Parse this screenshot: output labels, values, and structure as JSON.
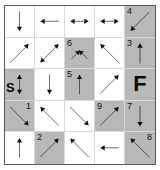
{
  "puzzle": {
    "title": "Arrow Maze Grid",
    "rows": 5,
    "columns": 5,
    "colors": {
      "shaded_cell": "#b8b8b8",
      "plain_cell": "#ffffff",
      "grid_line": "#d8d8d8",
      "frame_border": "#5a5a5a",
      "glyph": "#111111",
      "page_background": "#ffffff"
    },
    "start_marker": "S",
    "finish_marker": "F",
    "cells": [
      {
        "id": "r1c1",
        "row": 1,
        "col": 1,
        "shaded": false,
        "label": "",
        "label_pos": "",
        "arrow": "down",
        "arrow_name": "arrow-down"
      },
      {
        "id": "r1c2",
        "row": 1,
        "col": 2,
        "shaded": false,
        "label": "",
        "label_pos": "",
        "arrow": "left",
        "arrow_name": "arrow-left"
      },
      {
        "id": "r1c3",
        "row": 1,
        "col": 3,
        "shaded": false,
        "label": "",
        "label_pos": "",
        "arrow": "left-right",
        "arrow_name": "arrow-left-right"
      },
      {
        "id": "r1c4",
        "row": 1,
        "col": 4,
        "shaded": false,
        "label": "",
        "label_pos": "",
        "arrow": "left-right",
        "arrow_name": "arrow-left-right"
      },
      {
        "id": "r1c5",
        "row": 1,
        "col": 5,
        "shaded": true,
        "label": "4",
        "label_pos": "top-left",
        "arrow": "down-left",
        "arrow_name": "arrow-down-left"
      },
      {
        "id": "r2c1",
        "row": 2,
        "col": 1,
        "shaded": false,
        "label": "",
        "label_pos": "",
        "arrow": "up-right",
        "arrow_name": "arrow-up-right"
      },
      {
        "id": "r2c2",
        "row": 2,
        "col": 2,
        "shaded": false,
        "label": "",
        "label_pos": "",
        "arrow": "up-right-down-left",
        "arrow_name": "arrow-up-right-down-left"
      },
      {
        "id": "r2c3",
        "row": 2,
        "col": 3,
        "shaded": true,
        "label": "6",
        "label_pos": "top-left",
        "arrow": "peak",
        "arrow_name": "arrow-peak-up"
      },
      {
        "id": "r2c4",
        "row": 2,
        "col": 4,
        "shaded": false,
        "label": "",
        "label_pos": "",
        "arrow": "up-left",
        "arrow_name": "arrow-up-left"
      },
      {
        "id": "r2c5",
        "row": 2,
        "col": 5,
        "shaded": true,
        "label": "3",
        "label_pos": "top-left",
        "arrow": "up",
        "arrow_name": "arrow-up"
      },
      {
        "id": "r3c1",
        "row": 3,
        "col": 1,
        "shaded": true,
        "label": "S",
        "label_pos": "letter-s",
        "arrow": "up-down",
        "arrow_name": "arrow-up-down"
      },
      {
        "id": "r3c2",
        "row": 3,
        "col": 2,
        "shaded": false,
        "label": "",
        "label_pos": "",
        "arrow": "down",
        "arrow_name": "arrow-down"
      },
      {
        "id": "r3c3",
        "row": 3,
        "col": 3,
        "shaded": true,
        "label": "5",
        "label_pos": "top-left",
        "arrow": "up",
        "arrow_name": "arrow-up"
      },
      {
        "id": "r3c4",
        "row": 3,
        "col": 4,
        "shaded": false,
        "label": "",
        "label_pos": "",
        "arrow": "up-right",
        "arrow_name": "arrow-up-right"
      },
      {
        "id": "r3c5",
        "row": 3,
        "col": 5,
        "shaded": true,
        "label": "F",
        "label_pos": "letter-f",
        "arrow": "none",
        "arrow_name": "no-arrow"
      },
      {
        "id": "r4c1",
        "row": 4,
        "col": 1,
        "shaded": true,
        "label": "1",
        "label_pos": "top-right",
        "arrow": "down-right",
        "arrow_name": "arrow-down-right"
      },
      {
        "id": "r4c2",
        "row": 4,
        "col": 2,
        "shaded": false,
        "label": "",
        "label_pos": "",
        "arrow": "up-left",
        "arrow_name": "arrow-up-left"
      },
      {
        "id": "r4c3",
        "row": 4,
        "col": 3,
        "shaded": false,
        "label": "",
        "label_pos": "",
        "arrow": "down-right",
        "arrow_name": "arrow-down-right"
      },
      {
        "id": "r4c4",
        "row": 4,
        "col": 4,
        "shaded": true,
        "label": "9",
        "label_pos": "top-left",
        "arrow": "up-right",
        "arrow_name": "arrow-up-right"
      },
      {
        "id": "r4c5",
        "row": 4,
        "col": 5,
        "shaded": true,
        "label": "7",
        "label_pos": "top-left",
        "arrow": "down",
        "arrow_name": "arrow-down"
      },
      {
        "id": "r5c1",
        "row": 5,
        "col": 1,
        "shaded": false,
        "label": "",
        "label_pos": "",
        "arrow": "up",
        "arrow_name": "arrow-up"
      },
      {
        "id": "r5c2",
        "row": 5,
        "col": 2,
        "shaded": true,
        "label": "2",
        "label_pos": "top-left",
        "arrow": "up-right",
        "arrow_name": "arrow-up-right"
      },
      {
        "id": "r5c3",
        "row": 5,
        "col": 3,
        "shaded": false,
        "label": "",
        "label_pos": "",
        "arrow": "up-left",
        "arrow_name": "arrow-up-left"
      },
      {
        "id": "r5c4",
        "row": 5,
        "col": 4,
        "shaded": false,
        "label": "",
        "label_pos": "",
        "arrow": "left",
        "arrow_name": "arrow-left"
      },
      {
        "id": "r5c5",
        "row": 5,
        "col": 5,
        "shaded": true,
        "label": "8",
        "label_pos": "top-right",
        "arrow": "up-left",
        "arrow_name": "arrow-up-left"
      }
    ]
  }
}
